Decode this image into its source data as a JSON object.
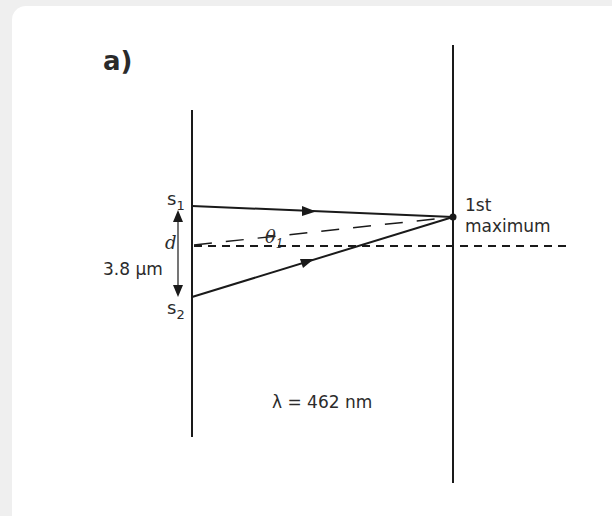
{
  "part_label": "a)",
  "sources": {
    "s1": {
      "letter": "s",
      "sub": "1"
    },
    "s2": {
      "letter": "s",
      "sub": "2"
    }
  },
  "separation": {
    "symbol": "d",
    "value": "3.8 μm"
  },
  "angle": {
    "symbol": "θ",
    "sub": "1"
  },
  "maximum_label": {
    "line1": "1st",
    "line2": "maximum"
  },
  "wavelength": "λ = 462 nm",
  "colors": {
    "line": "#1a1a1a",
    "panel": "#ffffff",
    "background": "#efefef"
  }
}
